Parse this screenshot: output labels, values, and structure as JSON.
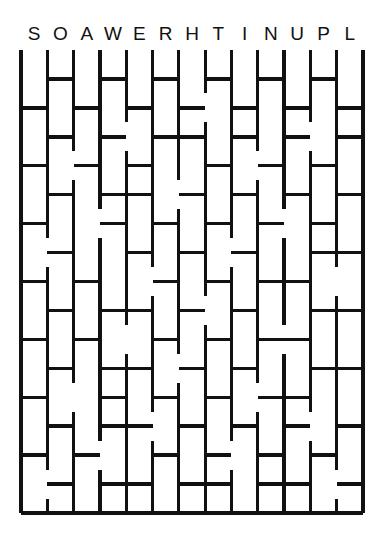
{
  "puzzle": {
    "type": "letter-ladder-maze",
    "title": "",
    "letters": [
      "S",
      "O",
      "A",
      "W",
      "E",
      "R",
      "H",
      "T",
      "I",
      "N",
      "U",
      "P",
      "L"
    ],
    "letter_count": 13,
    "colors": {
      "ink": "#111111",
      "background": "#ffffff"
    },
    "geometry": {
      "rail_count": 14,
      "row_count": 15,
      "grid_left": 21,
      "grid_right": 363,
      "grid_top": 50,
      "grid_bottom": 513,
      "column_spacing": 26.3,
      "row_spacing": 30.9,
      "letter_baseline_y": 40
    },
    "borders": {
      "left": true,
      "right": true,
      "top": false,
      "bottom": true
    },
    "rungs": [
      [
        0,
        1,
        0,
        1,
        0,
        1,
        0,
        1,
        0,
        1,
        0,
        1,
        0
      ],
      [
        1,
        0,
        1,
        0,
        1,
        0,
        1,
        0,
        1,
        0,
        1,
        0,
        1
      ],
      [
        0,
        1,
        0,
        1,
        0,
        1,
        1,
        0,
        1,
        0,
        1,
        0,
        1
      ],
      [
        1,
        0,
        1,
        0,
        1,
        0,
        0,
        1,
        0,
        1,
        0,
        1,
        0
      ],
      [
        0,
        1,
        0,
        1,
        1,
        0,
        1,
        0,
        1,
        0,
        1,
        0,
        1
      ],
      [
        1,
        0,
        0,
        1,
        0,
        1,
        0,
        1,
        0,
        1,
        0,
        1,
        0
      ],
      [
        0,
        1,
        0,
        0,
        1,
        0,
        1,
        0,
        1,
        0,
        0,
        1,
        1
      ],
      [
        1,
        0,
        1,
        0,
        0,
        1,
        0,
        1,
        0,
        1,
        1,
        0,
        0
      ],
      [
        0,
        1,
        0,
        1,
        1,
        0,
        1,
        0,
        1,
        0,
        0,
        1,
        1
      ],
      [
        1,
        0,
        1,
        0,
        0,
        1,
        0,
        1,
        0,
        1,
        1,
        0,
        0
      ],
      [
        0,
        1,
        0,
        1,
        1,
        0,
        1,
        0,
        1,
        0,
        0,
        1,
        1
      ],
      [
        1,
        0,
        0,
        1,
        0,
        1,
        0,
        1,
        0,
        1,
        1,
        0,
        0
      ],
      [
        0,
        1,
        0,
        1,
        1,
        0,
        1,
        0,
        1,
        0,
        1,
        0,
        1
      ],
      [
        1,
        0,
        1,
        0,
        0,
        1,
        0,
        1,
        0,
        1,
        0,
        1,
        0
      ],
      [
        0,
        1,
        0,
        1,
        1,
        0,
        1,
        1,
        0,
        1,
        1,
        0,
        1
      ]
    ],
    "rail_gaps": [
      {
        "rail": 1,
        "rows": [
          6,
          14
        ]
      },
      {
        "rail": 2,
        "rows": [
          3,
          11
        ]
      },
      {
        "rail": 3,
        "rows": [
          5,
          13
        ]
      },
      {
        "rail": 4,
        "rows": [
          2,
          9
        ]
      },
      {
        "rail": 5,
        "rows": [
          7,
          12
        ]
      },
      {
        "rail": 6,
        "rows": [
          4,
          10
        ]
      },
      {
        "rail": 7,
        "rows": [
          1,
          8
        ]
      },
      {
        "rail": 8,
        "rows": [
          6,
          13
        ]
      },
      {
        "rail": 9,
        "rows": [
          3,
          11
        ]
      },
      {
        "rail": 10,
        "rows": [
          5,
          9
        ]
      },
      {
        "rail": 11,
        "rows": [
          2,
          12
        ]
      },
      {
        "rail": 12,
        "rows": [
          7,
          14
        ]
      }
    ]
  }
}
